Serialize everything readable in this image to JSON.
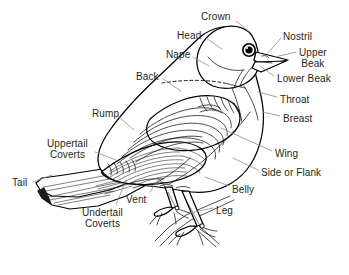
{
  "figure": {
    "background_color": "#ffffff",
    "ink_color": "#000000",
    "label_color": "#231f20",
    "leader_line_color": "#8d8d8d",
    "width": 349,
    "height": 275
  },
  "labels": [
    {
      "id": "crown",
      "text": "Crown",
      "x": 201,
      "y": 11,
      "align": "left"
    },
    {
      "id": "head",
      "text": "Head",
      "x": 177,
      "y": 30,
      "align": "left"
    },
    {
      "id": "nape",
      "text": "Nape",
      "x": 166,
      "y": 49,
      "align": "left"
    },
    {
      "id": "back",
      "text": "Back",
      "x": 136,
      "y": 71,
      "align": "left"
    },
    {
      "id": "rump",
      "text": "Rump",
      "x": 92,
      "y": 108,
      "align": "left"
    },
    {
      "id": "uppertail-coverts",
      "text": "Uppertail\nCoverts",
      "x": 47,
      "y": 138,
      "align": "center"
    },
    {
      "id": "tail",
      "text": "Tail",
      "x": 12,
      "y": 177,
      "align": "left"
    },
    {
      "id": "undertail-coverts",
      "text": "Undertail\nCoverts",
      "x": 82,
      "y": 207,
      "align": "center"
    },
    {
      "id": "vent",
      "text": "Vent",
      "x": 126,
      "y": 194,
      "align": "left"
    },
    {
      "id": "leg",
      "text": "Leg",
      "x": 216,
      "y": 205,
      "align": "left"
    },
    {
      "id": "belly",
      "text": "Belly",
      "x": 232,
      "y": 184,
      "align": "left"
    },
    {
      "id": "side-or-flank",
      "text": "Side or Flank",
      "x": 261,
      "y": 167,
      "align": "left"
    },
    {
      "id": "wing",
      "text": "Wing",
      "x": 275,
      "y": 148,
      "align": "left"
    },
    {
      "id": "breast",
      "text": "Breast",
      "x": 283,
      "y": 113,
      "align": "left"
    },
    {
      "id": "throat",
      "text": "Throat",
      "x": 280,
      "y": 94,
      "align": "left"
    },
    {
      "id": "lower-beak",
      "text": "Lower Beak",
      "x": 277,
      "y": 73,
      "align": "left"
    },
    {
      "id": "upper-beak",
      "text": "Upper\nBeak",
      "x": 299,
      "y": 47,
      "align": "center"
    },
    {
      "id": "nostril",
      "text": "Nostril",
      "x": 283,
      "y": 31,
      "align": "left"
    }
  ],
  "leader_lines": [
    {
      "id": "leader-crown",
      "d": "M 236 21 L 252 34"
    },
    {
      "id": "leader-head",
      "d": "M 206 38 L 222 49"
    },
    {
      "id": "leader-nape",
      "d": "M 193 57 L 209 66"
    },
    {
      "id": "leader-back",
      "d": "M 163 79 L 181 91"
    },
    {
      "id": "leader-rump",
      "d": "M 118 116 L 134 130"
    },
    {
      "id": "leader-uppertail-coverts",
      "d": "M 95 152 L 116 160"
    },
    {
      "id": "leader-tail",
      "d": "M 33 182 L 52 175"
    },
    {
      "id": "leader-undertail-coverts",
      "d": "M 116 205 L 126 180"
    },
    {
      "id": "leader-vent",
      "d": "M 150 192 L 160 177"
    },
    {
      "id": "leader-leg",
      "d": "M 213 208 L 190 213"
    },
    {
      "id": "leader-belly",
      "d": "M 229 186 L 205 177"
    },
    {
      "id": "leader-side-or-flank",
      "d": "M 258 170 L 233 158"
    },
    {
      "id": "leader-wing",
      "d": "M 272 151 L 221 128"
    },
    {
      "id": "leader-breast",
      "d": "M 280 116 L 263 112"
    },
    {
      "id": "leader-throat",
      "d": "M 277 97 L 258 92"
    },
    {
      "id": "leader-lower-beak",
      "d": "M 274 76 L 260 66"
    },
    {
      "id": "leader-upper-beak",
      "d": "M 296 52 L 275 57"
    },
    {
      "id": "leader-nostril",
      "d": "M 281 38 L 268 53"
    }
  ]
}
